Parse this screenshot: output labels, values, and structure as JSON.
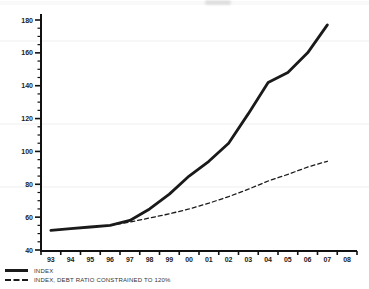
{
  "page": {
    "background": "#ffffff",
    "axis_color": "#111111",
    "label_color": "#222222"
  },
  "chart_data": {
    "type": "line",
    "title": "",
    "categories": [
      "93",
      "94",
      "95",
      "96",
      "97",
      "98",
      "99",
      "00",
      "01",
      "02",
      "03",
      "04",
      "05",
      "06",
      "07",
      "08"
    ],
    "xlabel": "",
    "ylabel": "",
    "ylim": [
      40,
      180
    ],
    "y_major_step": 20,
    "y_minor_step": 5,
    "grid": false,
    "legend_position": "bottom-left",
    "line_color": "#1a1a1a",
    "series": [
      {
        "name": "INDEX",
        "style": "solid",
        "x": [
          "93",
          "94",
          "95",
          "96",
          "97",
          "98",
          "99",
          "00",
          "01",
          "02",
          "03",
          "04",
          "05",
          "06",
          "07"
        ],
        "values": [
          52,
          53,
          54,
          55,
          58,
          65,
          74,
          85,
          94,
          105,
          123,
          142,
          148,
          160,
          177
        ]
      },
      {
        "name": "INDEX, DEBT RATIO CONSTRAINED TO 120%",
        "style": "dashed",
        "x": [
          "96",
          "97",
          "98",
          "99",
          "00",
          "01",
          "02",
          "03",
          "04",
          "05",
          "06",
          "07"
        ],
        "values": [
          55,
          57,
          59.5,
          62,
          65,
          68.5,
          72.5,
          77,
          82,
          86,
          90.5,
          94
        ]
      }
    ]
  },
  "legend": {
    "items": [
      {
        "label": "INDEX"
      },
      {
        "label": "INDEX, DEBT RATIO CONSTRAINED TO 120%"
      }
    ]
  }
}
